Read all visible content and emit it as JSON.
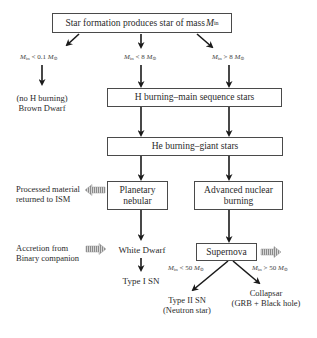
{
  "diagram": {
    "title_box": {
      "text": "Star formation produces star of mass ",
      "symbol": "M",
      "sub": "in"
    },
    "conditions": {
      "low": {
        "m": "M",
        "sub": "in",
        "op": " < 0.1 ",
        "m2": "M",
        "sub2": "⊙"
      },
      "mid": {
        "m": "M",
        "sub": "in",
        "op": " < 8 ",
        "m2": "M",
        "sub2": "⊙"
      },
      "high": {
        "m": "M",
        "sub": "in",
        "op": " > 8 ",
        "m2": "M",
        "sub2": "⊙"
      },
      "sn_low": {
        "m": "M",
        "sub": "in",
        "op": " < 50 ",
        "m2": "M",
        "sub2": "⊙"
      },
      "sn_high": {
        "m": "M",
        "sub": "in",
        "op": " > 50 ",
        "m2": "M",
        "sub2": "⊙"
      }
    },
    "brown_dwarf": {
      "line1": "(no H burning)",
      "line2": "Brown Dwarf"
    },
    "h_burning": "H burning–main sequence stars",
    "he_burning": "He burning–giant stars",
    "planetary": {
      "line1": "Planetary",
      "line2": "nebular"
    },
    "advanced": {
      "line1": "Advanced nuclear",
      "line2": "burning"
    },
    "ism": {
      "line1": "Processed material",
      "line2": "returned to ISM"
    },
    "accretion": {
      "line1": "Accretion from",
      "line2": "Binary companion"
    },
    "white_dwarf": "White Dwarf",
    "type1": "Type I SN",
    "supernova": "Supernova",
    "type2": {
      "line1": "Type II SN",
      "line2": "(Neutron star)"
    },
    "collapsar": {
      "line1": "Collapsar",
      "line2": "(GRB + Black hole)"
    },
    "colors": {
      "line": "#2a2a2a",
      "box_border": "#4a4a4a",
      "hatched_arrow": "#9a9a9a"
    }
  }
}
